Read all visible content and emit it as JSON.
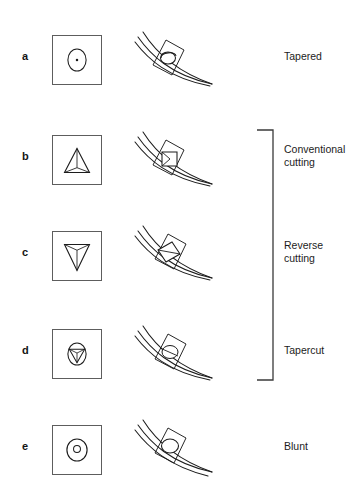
{
  "figure": {
    "stroke_color": "#1c1c1c",
    "box_border_color": "#5d5d5d",
    "background": "#ffffff"
  },
  "rows": [
    {
      "letter": "a",
      "label": "Tapered",
      "cross_section_icon": "circle-with-center-dot-icon",
      "needle_icon": "curved-needle-icon",
      "top": 20
    },
    {
      "letter": "b",
      "label": "Conventional\ncutting",
      "label_line1": "Conventional",
      "label_line2": "cutting",
      "cross_section_icon": "triangle-up-icon",
      "needle_icon": "curved-needle-icon",
      "top": 120
    },
    {
      "letter": "c",
      "label": "Reverse\ncutting",
      "label_line1": "Reverse",
      "label_line2": "cutting",
      "cross_section_icon": "triangle-down-icon",
      "needle_icon": "curved-needle-icon",
      "top": 216
    },
    {
      "letter": "d",
      "label": "Tapercut",
      "label_line1": "Tapercut",
      "label_line2": "",
      "cross_section_icon": "circle-with-triangle-down-icon",
      "needle_icon": "curved-needle-icon",
      "top": 314
    },
    {
      "letter": "e",
      "label": "Blunt",
      "label_line1": "Blunt",
      "label_line2": "",
      "cross_section_icon": "circle-with-inner-circle-icon",
      "needle_icon": "curved-needle-icon",
      "top": 410
    }
  ],
  "bracket": {
    "name": "cutting-needles-group-bracket",
    "groups": [
      "b",
      "c",
      "d"
    ],
    "top": 129,
    "height": 252
  }
}
